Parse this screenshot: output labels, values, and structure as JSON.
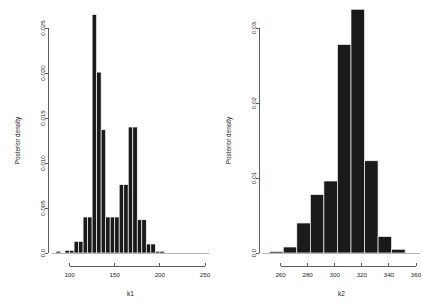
{
  "figure": {
    "background": "#ffffff",
    "bar_color": "#1a1a1a",
    "axis_color": "#4d4d4d",
    "panel_count": 2
  },
  "chart_data": [
    {
      "type": "bar",
      "title": "",
      "xlabel": "k1",
      "ylabel": "Posterior density",
      "xlim": [
        85,
        250
      ],
      "ylim": [
        0,
        0.0265
      ],
      "xticks": [
        100,
        150,
        200,
        250
      ],
      "xtick_labels": [
        "100",
        "150",
        "200",
        "250"
      ],
      "yticks": [
        0.0,
        0.005,
        0.01,
        0.015,
        0.02,
        0.025
      ],
      "ytick_labels": [
        "0.0",
        "0.005",
        "0.010",
        "0.015",
        "0.020",
        "0.025"
      ],
      "grid": false,
      "legend": "none",
      "bin_edges": [
        85,
        90,
        95,
        100,
        105,
        110,
        115,
        120,
        125,
        130,
        135,
        140,
        145,
        150,
        155,
        160,
        165,
        170,
        175,
        180,
        185,
        190,
        195,
        200,
        205,
        210,
        215,
        220,
        225,
        230
      ],
      "values": [
        0.0002,
        0.0,
        0.0003,
        0.0003,
        0.0013,
        0.0013,
        0.004,
        0.004,
        0.0265,
        0.0201,
        0.0137,
        0.004,
        0.004,
        0.004,
        0.0076,
        0.0076,
        0.014,
        0.014,
        0.0037,
        0.0037,
        0.001,
        0.001,
        0.0002,
        0.0002,
        0.0,
        0.0,
        0.0,
        0.0,
        0.0
      ]
    },
    {
      "type": "bar",
      "title": "",
      "xlabel": "k2",
      "ylabel": "Posterior density",
      "xlim": [
        250,
        360
      ],
      "ylim": [
        0,
        0.0325
      ],
      "xticks": [
        240,
        260,
        280,
        300,
        320,
        340,
        360
      ],
      "xtick_labels": [
        "240",
        "260",
        "280",
        "300",
        "320",
        "340",
        "360"
      ],
      "yticks": [
        0.0,
        0.01,
        0.02,
        0.03
      ],
      "ytick_labels": [
        "0.0",
        "0.01",
        "0.02",
        "0.03"
      ],
      "grid": false,
      "legend": "none",
      "bin_edges": [
        252,
        262,
        272,
        282,
        292,
        302,
        312,
        322,
        332,
        342,
        352
      ],
      "values": [
        0.0002,
        0.0008,
        0.004,
        0.0078,
        0.0096,
        0.0278,
        0.0325,
        0.0123,
        0.0022,
        0.0005
      ]
    }
  ]
}
